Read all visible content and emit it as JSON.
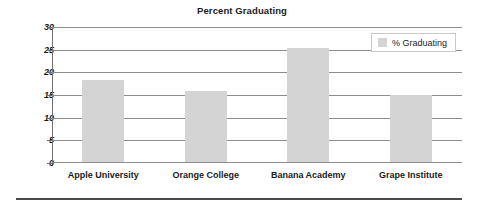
{
  "chart_data": {
    "type": "bar",
    "title": "Percent Graduating",
    "xlabel": "",
    "ylabel": "",
    "categories": [
      "Apple University",
      "Orange College",
      "Banana Academy",
      "Grape Institute"
    ],
    "values": [
      18.3,
      15.8,
      25.3,
      15.0
    ],
    "series": [
      {
        "name": "% Graduating",
        "values": [
          18.3,
          15.8,
          25.3,
          15.0
        ]
      }
    ],
    "ylim": [
      0,
      30
    ],
    "yticks": [
      0,
      5,
      10,
      15,
      20,
      25,
      30
    ],
    "ytick_labels": [
      "0",
      "5",
      "10",
      "15",
      "20",
      "25",
      "30"
    ],
    "grid": true,
    "legend": {
      "position": "top-right",
      "entries": [
        {
          "label": "% Graduating",
          "color": "#d4d4d4"
        }
      ]
    },
    "colors": {
      "bar": "#d4d4d4",
      "gridline": "#8e8e8e",
      "axis": "#6f6f6f",
      "text": "#1b1b1b",
      "rule": "#4a4a4a",
      "background": "#ffffff"
    }
  }
}
